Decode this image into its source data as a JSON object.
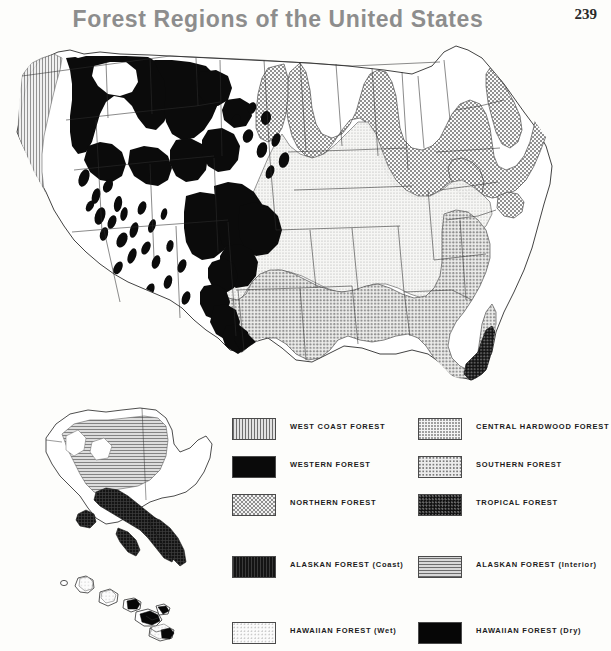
{
  "header": {
    "title": "Forest Regions of the United States",
    "page_number": "239"
  },
  "legend": {
    "entries": [
      {
        "label": "WEST COAST FOREST",
        "swatch": "sw-westcoast",
        "pattern": "vertical-lines",
        "color": "#9a9a9a",
        "x": 232,
        "y": 418
      },
      {
        "label": "WESTERN FOREST",
        "swatch": "sw-western",
        "pattern": "solid-black",
        "color": "#0a0a0a",
        "x": 232,
        "y": 456
      },
      {
        "label": "NORTHERN FOREST",
        "swatch": "sw-northern",
        "pattern": "checkerboard",
        "color": "#8f8f8f",
        "x": 232,
        "y": 494
      },
      {
        "label": "CENTRAL HARDWOOD FOREST",
        "swatch": "sw-centralhw",
        "pattern": "fine-stipple",
        "color": "#c9c9c9",
        "x": 418,
        "y": 418
      },
      {
        "label": "SOUTHERN FOREST",
        "swatch": "sw-southern",
        "pattern": "coarse-stipple",
        "color": "#a9a9a9",
        "x": 418,
        "y": 456
      },
      {
        "label": "TROPICAL FOREST",
        "swatch": "sw-tropical",
        "pattern": "dark-dots",
        "color": "#101010",
        "x": 418,
        "y": 494
      },
      {
        "label": "ALASKAN FOREST (Coast)",
        "swatch": "sw-akcoast",
        "pattern": "dark-grid",
        "color": "#161616",
        "x": 232,
        "y": 556
      },
      {
        "label": "ALASKAN FOREST (Interior)",
        "swatch": "sw-akinterior",
        "pattern": "horizontal-lines",
        "color": "#9f9f9f",
        "x": 418,
        "y": 556
      },
      {
        "label": "HAWAIIAN FOREST (Wet)",
        "swatch": "sw-hiwet",
        "pattern": "light-stipple",
        "color": "#ededed",
        "x": 232,
        "y": 622
      },
      {
        "label": "HAWAIIAN FOREST (Dry)",
        "swatch": "sw-hidry",
        "pattern": "solid-black",
        "color": "#060606",
        "x": 418,
        "y": 622
      }
    ]
  },
  "map": {
    "main_map_name": "contiguous-united-states",
    "insets": [
      {
        "name": "alaska-inset"
      },
      {
        "name": "hawaii-inset"
      }
    ],
    "line_color": "#2b2b2b",
    "background_color": "#ffffff"
  }
}
